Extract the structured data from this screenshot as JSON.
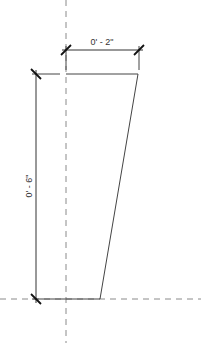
{
  "drawing": {
    "dimensions": {
      "width_label": "0' - 2\"",
      "height_label": "0' - 6\""
    },
    "colors": {
      "line": "#444444",
      "dashed": "#8a8a8a",
      "tick": "#111111",
      "background": "#ffffff"
    }
  }
}
